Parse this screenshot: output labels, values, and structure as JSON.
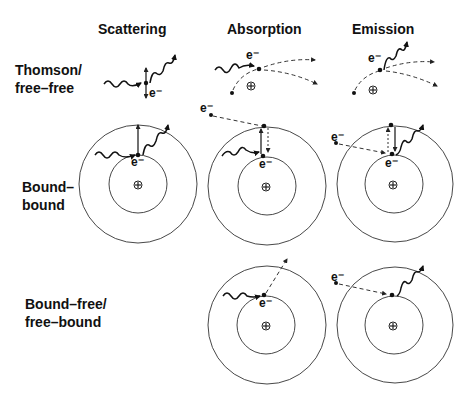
{
  "diagram": {
    "column_headers": [
      "Scattering",
      "Absorption",
      "Emission"
    ],
    "row_labels": [
      {
        "line1": "Thomson/",
        "line2": "free–free"
      },
      {
        "line1": "Bound–",
        "line2": "bound"
      },
      {
        "line1": "Bound–free/",
        "line2": "free–bound"
      }
    ],
    "electron_label": "e⁻",
    "nucleus_symbol": "⊕",
    "colors": {
      "ink": "#111111",
      "background": "#ffffff"
    },
    "cells": {
      "thomson_scattering": {
        "electron_label": "e⁻",
        "description": "photon scatters off free electron"
      },
      "thomson_absorption": {
        "electron_label": "e⁻",
        "description": "free electron absorbs photon near ion"
      },
      "thomson_emission": {
        "electron_label": "e⁻",
        "description": "free electron emits photon near ion"
      },
      "bound_bound_scattering": {
        "electron_label": "e⁻",
        "description": "bound electron scatters photon"
      },
      "bound_bound_absorption": {
        "electron_label": "e⁻",
        "incoming_label": "e⁻",
        "description": "bound electron absorbs photon and is excited"
      },
      "bound_bound_emission": {
        "electron_label": "e⁻",
        "incoming_label": "e⁻",
        "description": "bound electron de-excites and emits photon"
      },
      "bound_free_absorption": {
        "electron_label": "e⁻",
        "description": "photoionization"
      },
      "free_bound_emission": {
        "incoming_label": "e⁻",
        "description": "radiative recombination"
      }
    }
  }
}
